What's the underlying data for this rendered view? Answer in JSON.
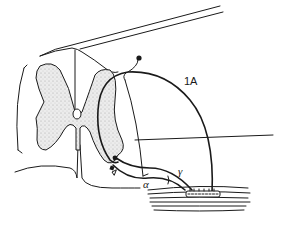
{
  "diagram": {
    "labels": {
      "afferent": "1A",
      "alpha_motor": "α",
      "gamma_motor": "γ"
    },
    "components": [
      "spinal-cord-section",
      "grey-matter",
      "central-canal",
      "1A-afferent-fiber",
      "dorsal-root-ganglion",
      "alpha-motor-neuron",
      "gamma-motor-neuron",
      "muscle",
      "muscle-spindle"
    ],
    "colors": {
      "line": "#1a1a1a",
      "grey_matter_fill": "#e2e2e2",
      "background": "#ffffff"
    }
  }
}
